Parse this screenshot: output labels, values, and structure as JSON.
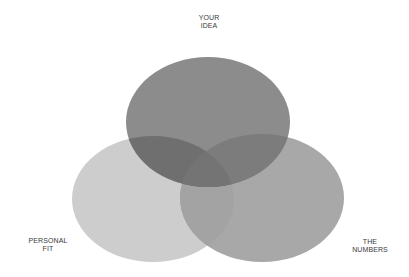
{
  "diagram": {
    "type": "venn",
    "sets": [
      {
        "id": "your-idea",
        "label_line1": "YOUR",
        "label_line2": "IDEA",
        "color": "#8c8c8c",
        "cx": 208,
        "cy": 122,
        "rx": 82,
        "ry": 65
      },
      {
        "id": "personal-fit",
        "label_line1": "PERSONAL",
        "label_line2": "FIT",
        "color": "#cdcdcd",
        "cx": 153,
        "cy": 199,
        "rx": 81,
        "ry": 63
      },
      {
        "id": "the-numbers",
        "label_line1": "THE",
        "label_line2": "NUMBERS",
        "color": "#a8a8a8",
        "cx": 262,
        "cy": 198,
        "rx": 82,
        "ry": 64
      }
    ],
    "overlap_colors": {
      "idea_fit": "#6f6f6f",
      "idea_numbers": "#7c7c7c",
      "fit_numbers": "#a3a3a3",
      "center": "#747474"
    }
  }
}
